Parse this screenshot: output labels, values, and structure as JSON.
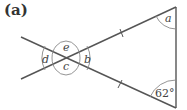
{
  "figure": {
    "label": "(a)",
    "line_color": "#555555",
    "arc_color": "#888888"
  },
  "angles": {
    "a": "a",
    "b": "b",
    "c": "c",
    "d": "d",
    "e": "e",
    "given": "62°"
  }
}
